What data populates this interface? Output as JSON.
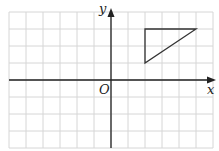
{
  "diagram": {
    "type": "coordinate-grid",
    "grid": {
      "columns": 12,
      "rows": 8,
      "cell_px": 17,
      "origin_px": [
        9,
        12
      ],
      "line_color": "#d6d6d6"
    },
    "axes": {
      "x_label": "x",
      "y_label": "y",
      "origin_label": "O",
      "origin_grid": [
        6,
        4
      ],
      "color": "#222222"
    },
    "shapes": [
      {
        "kind": "triangle",
        "vertices": [
          [
            2,
            3
          ],
          [
            5,
            3
          ],
          [
            2,
            1
          ]
        ],
        "stroke": "#333333"
      }
    ]
  }
}
